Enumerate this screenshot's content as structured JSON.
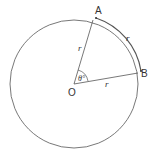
{
  "diagram": {
    "type": "circle-sector",
    "labels": {
      "center": "O",
      "point_a": "A",
      "point_b": "B",
      "radius_oa": "r",
      "radius_ob": "r",
      "arc_ab": "r",
      "angle": "θ°"
    },
    "colors": {
      "stroke": "#555555",
      "text": "#333333",
      "background": "#ffffff"
    }
  }
}
